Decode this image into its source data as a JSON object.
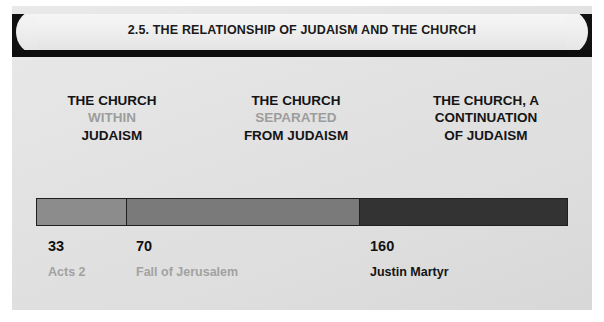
{
  "slide": {
    "title": "2.5. THE RELATIONSHIP OF JUDAISM AND THE CHURCH",
    "headings": [
      {
        "line1": "THE CHURCH",
        "line2": "WITHIN",
        "line3": "JUDAISM",
        "line2_muted": true
      },
      {
        "line1": "THE CHURCH",
        "line2": "SEPARATED",
        "line3": "FROM JUDAISM",
        "line2_muted": true
      },
      {
        "line1": "THE CHURCH, A",
        "line2": "CONTINUATION",
        "line3": "OF JUDAISM",
        "line2_muted": false
      }
    ],
    "timeline": {
      "segments": [
        {
          "name": "church-within-judaism",
          "color": "#8c8c8c",
          "width_pct": 16.7
        },
        {
          "name": "church-separated-from-judaism",
          "color": "#7a7a7a",
          "width_pct": 44.0
        },
        {
          "name": "church-continuation-of-judaism",
          "color": "#333333",
          "width_pct": 39.3
        }
      ],
      "markers": [
        {
          "date": "33",
          "event": "Acts 2",
          "muted": true,
          "left_px": 36
        },
        {
          "date": "70",
          "event": "Fall of Jerusalem",
          "muted": true,
          "left_px": 124
        },
        {
          "date": "160",
          "event": "Justin Martyr",
          "muted": false,
          "left_px": 358
        }
      ]
    },
    "colors": {
      "background": "#e4e4e4",
      "banner": "#efefef",
      "rule": "#0d0d0d",
      "text_dark": "#141414",
      "text_muted": "#9d9d9d"
    }
  }
}
